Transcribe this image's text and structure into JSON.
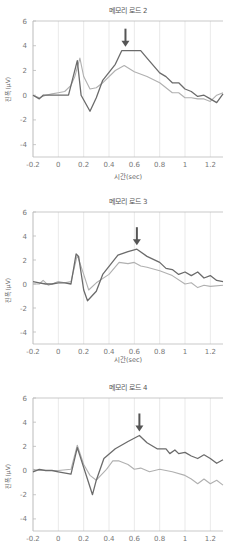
{
  "chart_data": [
    {
      "type": "line",
      "title": "메모리 로드 2",
      "xlabel": "시간(sec)",
      "ylabel": "진폭(μV)",
      "xlim": [
        -0.2,
        1.3
      ],
      "ylim": [
        -5,
        6
      ],
      "xticks": [
        "-0.2",
        "0",
        "0.2",
        "0.4",
        "0.6",
        "0.8",
        "1",
        "1.2"
      ],
      "yticks": [
        "6",
        "4",
        "2",
        "0",
        "-2",
        "-4"
      ],
      "grid": "vertical",
      "arrow_x": 0.53,
      "series": [
        {
          "name": "dark",
          "color": "#6b6b6b",
          "x": [
            -0.2,
            -0.15,
            -0.12,
            -0.05,
            0,
            0.08,
            0.1,
            0.15,
            0.18,
            0.25,
            0.3,
            0.35,
            0.45,
            0.5,
            0.55,
            0.65,
            0.7,
            0.8,
            0.85,
            0.9,
            0.95,
            1.0,
            1.05,
            1.1,
            1.15,
            1.2,
            1.25,
            1.3
          ],
          "y": [
            0,
            -0.3,
            0,
            0,
            0,
            0,
            0.8,
            2.8,
            0,
            -1.3,
            -0.2,
            1.2,
            2.5,
            3.6,
            3.6,
            3.6,
            3.0,
            1.8,
            1.5,
            1.0,
            1.0,
            0.5,
            0.3,
            -0.1,
            0,
            -0.3,
            -0.6,
            0.1
          ]
        },
        {
          "name": "light",
          "color": "#b0b0b0",
          "x": [
            -0.2,
            -0.15,
            -0.1,
            -0.05,
            0,
            0.05,
            0.1,
            0.13,
            0.17,
            0.2,
            0.25,
            0.3,
            0.35,
            0.45,
            0.52,
            0.6,
            0.7,
            0.8,
            0.9,
            0.95,
            1.0,
            1.05,
            1.1,
            1.15,
            1.2,
            1.25,
            1.3
          ],
          "y": [
            0,
            -0.2,
            0,
            0.1,
            0.2,
            0.3,
            0.8,
            1.5,
            3.0,
            1.5,
            0.5,
            0.6,
            1.0,
            2.0,
            2.4,
            1.9,
            1.5,
            1.0,
            0.2,
            0.2,
            -0.2,
            -0.2,
            -0.3,
            -0.3,
            -0.5,
            0,
            0.2
          ]
        }
      ]
    },
    {
      "type": "line",
      "title": "메모리 로드 3",
      "xlabel": "시간(sec)",
      "ylabel": "진폭(μV)",
      "xlim": [
        -0.2,
        1.3
      ],
      "ylim": [
        -5,
        6
      ],
      "xticks": [
        "-0.2",
        "0",
        "0.2",
        "0.4",
        "0.6",
        "0.8",
        "1",
        "1.2"
      ],
      "yticks": [
        "6",
        "4",
        "2",
        "0",
        "-2",
        "-4"
      ],
      "grid": "vertical",
      "arrow_x": 0.62,
      "series": [
        {
          "name": "dark",
          "color": "#6b6b6b",
          "x": [
            -0.2,
            -0.15,
            -0.1,
            -0.05,
            0,
            0.05,
            0.1,
            0.14,
            0.16,
            0.2,
            0.23,
            0.3,
            0.35,
            0.47,
            0.55,
            0.62,
            0.7,
            0.8,
            0.85,
            0.9,
            0.95,
            1.0,
            1.05,
            1.1,
            1.15,
            1.2,
            1.25,
            1.3
          ],
          "y": [
            0.2,
            0.1,
            0,
            0,
            0.1,
            0.1,
            0,
            2.5,
            2.3,
            -0.5,
            -1.4,
            -0.6,
            0.8,
            2.4,
            2.7,
            2.9,
            2.3,
            1.8,
            1.3,
            1.2,
            0.8,
            1.0,
            0.7,
            1.0,
            0.5,
            0.7,
            0.3,
            0.2
          ]
        },
        {
          "name": "light",
          "color": "#b0b0b0",
          "x": [
            -0.2,
            -0.15,
            -0.12,
            -0.08,
            -0.05,
            0,
            0.05,
            0.1,
            0.15,
            0.2,
            0.24,
            0.3,
            0.4,
            0.48,
            0.55,
            0.6,
            0.65,
            0.7,
            0.8,
            0.9,
            1.0,
            1.05,
            1.1,
            1.15,
            1.2,
            1.3
          ],
          "y": [
            0,
            0,
            0.3,
            -0.1,
            0,
            0.2,
            0.1,
            0.2,
            2.4,
            0.8,
            -0.5,
            0.1,
            0.8,
            1.8,
            1.7,
            1.8,
            1.5,
            1.4,
            1.1,
            0.7,
            0,
            0.1,
            -0.3,
            -0.1,
            -0.2,
            -0.1
          ]
        }
      ]
    },
    {
      "type": "line",
      "title": "메모리 로드 4",
      "xlabel": "",
      "ylabel": "진폭(μV)",
      "xlim": [
        -0.2,
        1.3
      ],
      "ylim": [
        -5,
        6
      ],
      "xticks": [
        "-0.2",
        "0",
        "0.2",
        "0.4",
        "0.6",
        "0.8",
        "1",
        "1.2"
      ],
      "yticks": [
        "6",
        "4",
        "2",
        "0",
        "-2",
        "-4"
      ],
      "grid": "vertical",
      "arrow_x": 0.64,
      "series": [
        {
          "name": "dark",
          "color": "#6b6b6b",
          "x": [
            -0.2,
            -0.15,
            -0.1,
            -0.05,
            0,
            0.1,
            0.15,
            0.27,
            0.3,
            0.36,
            0.45,
            0.55,
            0.64,
            0.7,
            0.78,
            0.85,
            0.88,
            0.92,
            0.95,
            1.0,
            1.05,
            1.1,
            1.15,
            1.2,
            1.25,
            1.3
          ],
          "y": [
            -0.1,
            0.1,
            0,
            0,
            -0.1,
            -0.3,
            1.9,
            -2.0,
            -0.8,
            1.0,
            1.8,
            2.4,
            2.9,
            2.3,
            1.8,
            1.8,
            1.4,
            1.7,
            1.4,
            1.5,
            1.2,
            1.0,
            1.3,
            1.0,
            0.6,
            0.9
          ]
        },
        {
          "name": "light",
          "color": "#b0b0b0",
          "x": [
            -0.2,
            -0.15,
            -0.1,
            -0.05,
            0,
            0.1,
            0.15,
            0.2,
            0.25,
            0.3,
            0.38,
            0.43,
            0.48,
            0.55,
            0.6,
            0.65,
            0.72,
            0.8,
            0.9,
            1.0,
            1.05,
            1.1,
            1.15,
            1.2,
            1.25,
            1.3
          ],
          "y": [
            0.1,
            0,
            0,
            0,
            0,
            0.1,
            2.1,
            0.5,
            -0.4,
            -0.8,
            0.1,
            0.8,
            0.8,
            0.5,
            0.1,
            0.2,
            -0.1,
            0.1,
            -0.1,
            -0.4,
            -0.7,
            -1.1,
            -0.7,
            -1.1,
            -0.8,
            -1.2
          ]
        }
      ]
    }
  ]
}
